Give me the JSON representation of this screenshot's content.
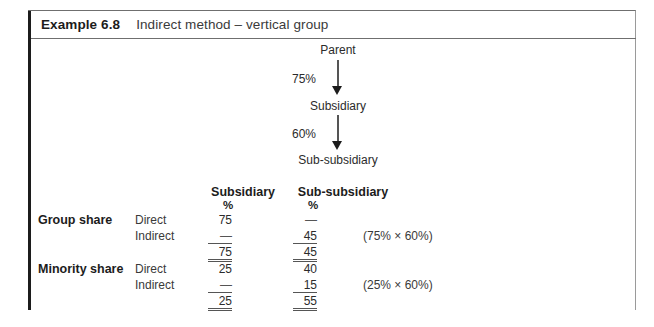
{
  "example": {
    "number_label": "Example 6.8",
    "title": "Indirect method – vertical group"
  },
  "diagram": {
    "nodes": [
      {
        "id": "parent",
        "label": "Parent"
      },
      {
        "id": "subsidiary",
        "label": "Subsidiary"
      },
      {
        "id": "sub-subsidiary",
        "label": "Sub-subsidiary"
      }
    ],
    "edges": [
      {
        "from": "parent",
        "to": "subsidiary",
        "label": "75%"
      },
      {
        "from": "subsidiary",
        "to": "sub-subsidiary",
        "label": "60%"
      }
    ]
  },
  "table": {
    "column_headers": [
      {
        "title": "Subsidiary",
        "unit": "%"
      },
      {
        "title": "Sub-subsidiary",
        "unit": "%"
      }
    ],
    "rows": [
      {
        "group": "Group share",
        "type": "Direct",
        "subsidiary": "75",
        "sub_subsidiary": "—",
        "formula": ""
      },
      {
        "group": "",
        "type": "Indirect",
        "subsidiary": "—",
        "sub_subsidiary": "45",
        "formula": "(75% × 60%)"
      },
      {
        "group": "",
        "type": "",
        "subsidiary": "75",
        "sub_subsidiary": "45",
        "formula": ""
      },
      {
        "group": "Minority share",
        "type": "Direct",
        "subsidiary": "25",
        "sub_subsidiary": "40",
        "formula": ""
      },
      {
        "group": "",
        "type": "Indirect",
        "subsidiary": "—",
        "sub_subsidiary": "15",
        "formula": "(25% × 60%)"
      },
      {
        "group": "",
        "type": "",
        "subsidiary": "25",
        "sub_subsidiary": "55",
        "formula": ""
      }
    ]
  },
  "colors": {
    "accent_rule": "#1c1c1c",
    "border": "#9a9a9a",
    "text": "#2b2b2b",
    "background": "#ffffff"
  }
}
